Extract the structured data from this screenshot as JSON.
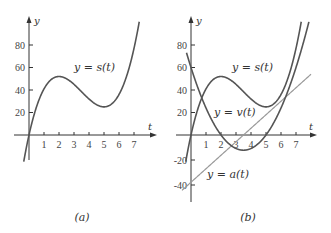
{
  "chart_data": [
    {
      "panel": "(a)",
      "type": "line",
      "title": "",
      "xlabel": "t",
      "ylabel": "y",
      "x_ticks": [
        1,
        2,
        3,
        4,
        5,
        6,
        7
      ],
      "y_ticks": [
        20,
        40,
        60,
        80
      ],
      "xlim": [
        -0.3,
        8.3
      ],
      "ylim": [
        -22,
        102
      ],
      "grid": false,
      "series": [
        {
          "name": "y = s(t)",
          "formula": "s(t) = 2t^3 - 21t^2 + 60t",
          "x": [
            0,
            1,
            2,
            3,
            4,
            5,
            6,
            7
          ],
          "values": [
            0,
            41,
            52,
            45,
            32,
            25,
            36,
            77
          ],
          "color": "#555555"
        }
      ],
      "annotations": [
        {
          "text": "y = s(t)",
          "near": [
            3.3,
            59
          ]
        }
      ]
    },
    {
      "panel": "(b)",
      "type": "line",
      "title": "",
      "xlabel": "t",
      "ylabel": "y",
      "x_ticks": [
        1,
        2,
        3,
        4,
        5,
        6,
        7
      ],
      "y_ticks": [
        -40,
        -20,
        20,
        40,
        60,
        80
      ],
      "xlim": [
        -0.3,
        8.3
      ],
      "ylim": [
        -55,
        102
      ],
      "grid": false,
      "series": [
        {
          "name": "y = s(t)",
          "formula": "s(t) = 2t^3 - 21t^2 + 60t",
          "x": [
            0,
            1,
            2,
            3,
            4,
            5,
            6,
            7
          ],
          "values": [
            0,
            41,
            52,
            45,
            32,
            25,
            36,
            77
          ],
          "color": "#555555"
        },
        {
          "name": "y = v(t)",
          "formula": "v(t) = 6t^2 - 42t + 60",
          "x": [
            0,
            1,
            2,
            3,
            4,
            5,
            6,
            7
          ],
          "values": [
            60,
            24,
            0,
            -12,
            -12,
            0,
            24,
            60
          ],
          "color": "#555555"
        },
        {
          "name": "y = a(t)",
          "formula": "a(t) = 12t - 42",
          "x": [
            0,
            1,
            2,
            3,
            4,
            5,
            6,
            7
          ],
          "values": [
            -42,
            -30,
            -18,
            -6,
            6,
            18,
            30,
            42
          ],
          "color": "#9a9a9a"
        }
      ],
      "annotations": [
        {
          "text": "y = s(t)",
          "near": [
            3.2,
            59
          ]
        },
        {
          "text": "y = v(t)",
          "near": [
            2.2,
            20
          ]
        },
        {
          "text": "y = a(t)",
          "near": [
            1.9,
            -35
          ]
        }
      ]
    }
  ],
  "panels": {
    "a": {
      "caption": "(a)",
      "axis_x_label": "t",
      "axis_y_label": "y",
      "curve_label": "y = s(t)",
      "x_tick_labels": [
        "1",
        "2",
        "3",
        "4",
        "5",
        "6",
        "7"
      ],
      "y_tick_labels": [
        "20",
        "40",
        "60",
        "80"
      ]
    },
    "b": {
      "caption": "(b)",
      "axis_x_label": "t",
      "axis_y_label": "y",
      "s_label": "y = s(t)",
      "v_label": "y = v(t)",
      "a_label": "y = a(t)",
      "x_tick_labels": [
        "1",
        "2",
        "3",
        "4",
        "5",
        "6",
        "7"
      ],
      "y_tick_labels": [
        "80",
        "60",
        "40",
        "20",
        "-20",
        "-40"
      ]
    }
  },
  "colors": {
    "axis": "#333333",
    "dark_curve": "#555555",
    "light_curve": "#9a9a9a"
  }
}
